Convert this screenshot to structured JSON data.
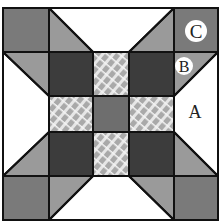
{
  "diagram": {
    "type": "quilt-block",
    "grid": "5x5 patchwork with star points",
    "labels": {
      "A": "A",
      "B": "B",
      "C": "C"
    },
    "colors": {
      "corner_square": "#7a7a7a",
      "triangle_medium": "#9a9a9a",
      "dark_square": "#3c3c3c",
      "plaid_square": "#b8b8b8",
      "center_square": "#6e6e6e",
      "background": "#ffffff",
      "outline": "#111111"
    }
  }
}
